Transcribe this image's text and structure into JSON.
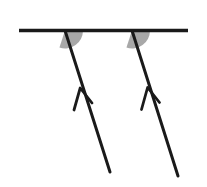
{
  "figure": {
    "type": "geometry-diagram",
    "canvas": {
      "width": 207,
      "height": 187,
      "background": "#ffffff"
    },
    "colors": {
      "stroke": "#1a1a1a",
      "angle_fill": "#a8a8a8",
      "background": "#ffffff"
    },
    "horizontal_line": {
      "label": "horizontal-line",
      "x1": 19,
      "y1": 30.5,
      "x2": 188,
      "y2": 30.5,
      "stroke_width": 3.4
    },
    "transversals": [
      {
        "label": "left-transversal",
        "top_x": 65,
        "top_y": 30.5,
        "bottom_x": 110,
        "bottom_y": 172,
        "stroke_width": 3.0,
        "arrow": {
          "label": "left-arrowhead",
          "tip_x": 80.2,
          "tip_y": 88.0,
          "barb_left_x": 74.0,
          "barb_left_y": 110.0,
          "barb_right_x": 92.0,
          "barb_right_y": 103.0,
          "stroke_width": 2.8,
          "direction": "up-left"
        },
        "angle_arc": {
          "label": "left-angle-arc",
          "center_x": 65,
          "center_y": 30.5,
          "radius": 18,
          "start_deg": 0,
          "end_deg": 108,
          "fill": "#a8a8a8"
        }
      },
      {
        "label": "right-transversal",
        "top_x": 132,
        "top_y": 30.5,
        "bottom_x": 178,
        "bottom_y": 176,
        "stroke_width": 3.0,
        "arrow": {
          "label": "right-arrowhead",
          "tip_x": 147.6,
          "tip_y": 87.5,
          "barb_left_x": 141.5,
          "barb_left_y": 109.5,
          "barb_right_x": 159.5,
          "barb_right_y": 102.5,
          "stroke_width": 2.8,
          "direction": "up-left"
        },
        "angle_arc": {
          "label": "right-angle-arc",
          "center_x": 132,
          "center_y": 30.5,
          "radius": 18,
          "start_deg": 0,
          "end_deg": 108,
          "fill": "#a8a8a8"
        }
      }
    ]
  }
}
